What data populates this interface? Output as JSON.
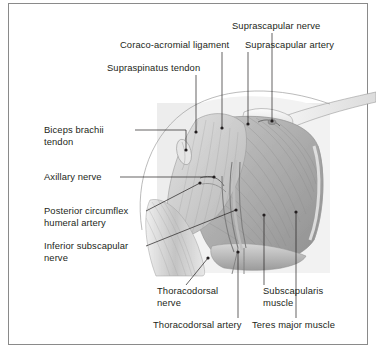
{
  "figure": {
    "style": "grayscale medical illustration with leader-line labels",
    "frame_color": "#8a8a8a",
    "text_color": "#231f20",
    "tint_color": "#eeeeee"
  },
  "labels": {
    "suprascapular_nerve": "Suprascapular nerve",
    "suprascapular_artery": "Suprascapular artery",
    "coraco_acromial_ligament": "Coraco-acromial ligament",
    "supraspinatus_tendon": "Supraspinatus tendon",
    "biceps_brachii_tendon_l1": "Biceps brachii",
    "biceps_brachii_tendon_l2": "tendon",
    "axillary_nerve": "Axillary nerve",
    "posterior_circumflex_l1": "Posterior circumflex",
    "posterior_circumflex_l2": "humeral artery",
    "inferior_subscapular_l1": "Inferior subscapular",
    "inferior_subscapular_l2": "nerve",
    "thoracodorsal_nerve_l1": "Thoracodorsal",
    "thoracodorsal_nerve_l2": "nerve",
    "thoracodorsal_artery": "Thoracodorsal artery",
    "subscapularis_muscle_l1": "Subscapularis",
    "subscapularis_muscle_l2": "muscle",
    "teres_major_muscle": "Teres major muscle"
  }
}
